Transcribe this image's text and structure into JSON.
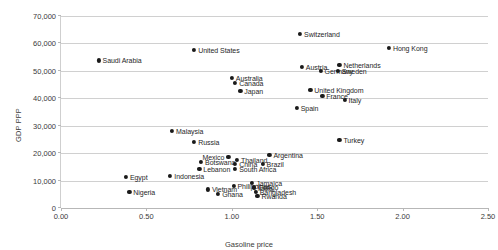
{
  "chart_data": {
    "type": "scatter",
    "title": "",
    "xlabel": "Gasoline price",
    "ylabel": "GDP PPP",
    "xlim": [
      0.0,
      2.5
    ],
    "ylim": [
      0,
      70000
    ],
    "xticks": [
      "0.00",
      "0.50",
      "1.00",
      "1.50",
      "2.00",
      "2.50"
    ],
    "xtick_values": [
      0.0,
      0.5,
      1.0,
      1.5,
      2.0,
      2.5
    ],
    "yticks": [
      "0",
      "10,000",
      "20,000",
      "30,000",
      "40,000",
      "50,000",
      "60,000",
      "70,000"
    ],
    "ytick_values": [
      0,
      10000,
      20000,
      30000,
      40000,
      50000,
      60000,
      70000
    ],
    "grid": "horizontal",
    "legend": "none",
    "marker_color": "#1a1a1a",
    "gridline_color": "#d0d0d0",
    "points": [
      {
        "label": "Saudi Arabia",
        "x": 0.22,
        "y": 53800,
        "side": "right"
      },
      {
        "label": "United States",
        "x": 0.78,
        "y": 57500,
        "side": "right"
      },
      {
        "label": "Switzerland",
        "x": 1.4,
        "y": 63500,
        "side": "right"
      },
      {
        "label": "Hong Kong",
        "x": 1.92,
        "y": 58500,
        "side": "right"
      },
      {
        "label": "Netherlands",
        "x": 1.63,
        "y": 52200,
        "side": "right"
      },
      {
        "label": "Sweden",
        "x": 1.62,
        "y": 50000,
        "side": "right"
      },
      {
        "label": "Austria",
        "x": 1.41,
        "y": 51300,
        "side": "right"
      },
      {
        "label": "Germany",
        "x": 1.52,
        "y": 50000,
        "side": "right"
      },
      {
        "label": "Australia",
        "x": 1.0,
        "y": 47300,
        "side": "right"
      },
      {
        "label": "Canada",
        "x": 1.02,
        "y": 45500,
        "side": "right"
      },
      {
        "label": "Japan",
        "x": 1.05,
        "y": 42800,
        "side": "right"
      },
      {
        "label": "United Kingdom",
        "x": 1.46,
        "y": 43200,
        "side": "right"
      },
      {
        "label": "France",
        "x": 1.53,
        "y": 41000,
        "side": "right"
      },
      {
        "label": "Italy",
        "x": 1.66,
        "y": 39500,
        "side": "right"
      },
      {
        "label": "Spain",
        "x": 1.38,
        "y": 36500,
        "side": "right"
      },
      {
        "label": "Turkey",
        "x": 1.63,
        "y": 24800,
        "side": "right"
      },
      {
        "label": "Malaysia",
        "x": 0.65,
        "y": 28000,
        "side": "right"
      },
      {
        "label": "Russia",
        "x": 0.78,
        "y": 24000,
        "side": "right"
      },
      {
        "label": "Mexico",
        "x": 0.98,
        "y": 18700,
        "side": "left"
      },
      {
        "label": "Argentina",
        "x": 1.22,
        "y": 19500,
        "side": "right"
      },
      {
        "label": "Thailand",
        "x": 1.03,
        "y": 17400,
        "side": "right"
      },
      {
        "label": "Botswana",
        "x": 0.82,
        "y": 16700,
        "side": "right"
      },
      {
        "label": "China",
        "x": 1.02,
        "y": 16200,
        "side": "right"
      },
      {
        "label": "Brazil",
        "x": 1.18,
        "y": 16100,
        "side": "right"
      },
      {
        "label": "Lebanon",
        "x": 0.81,
        "y": 14400,
        "side": "right"
      },
      {
        "label": "South Africa",
        "x": 1.02,
        "y": 14300,
        "side": "right"
      },
      {
        "label": "Egypt",
        "x": 0.38,
        "y": 11200,
        "side": "right"
      },
      {
        "label": "Indonesia",
        "x": 0.64,
        "y": 11600,
        "side": "right"
      },
      {
        "label": "Jamaica",
        "x": 1.12,
        "y": 9200,
        "side": "right"
      },
      {
        "label": "Philippines",
        "x": 1.01,
        "y": 8200,
        "side": "right"
      },
      {
        "label": "Congo",
        "x": 1.13,
        "y": 7600,
        "side": "right"
      },
      {
        "label": "India",
        "x": 1.13,
        "y": 7300,
        "side": "right"
      },
      {
        "label": "Nigeria",
        "x": 0.4,
        "y": 6000,
        "side": "right"
      },
      {
        "label": "Vietnam",
        "x": 0.86,
        "y": 6800,
        "side": "right"
      },
      {
        "label": "Bangladesh",
        "x": 1.14,
        "y": 5900,
        "side": "right"
      },
      {
        "label": "Ghana",
        "x": 0.92,
        "y": 5100,
        "side": "right"
      },
      {
        "label": "Rwanda",
        "x": 1.15,
        "y": 4400,
        "side": "right"
      }
    ]
  }
}
